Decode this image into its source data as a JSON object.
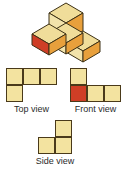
{
  "figure": {
    "colors": {
      "cube_top_face": "#f0dd9a",
      "cube_left_face": "#f2e3ab",
      "cube_right_face": "#e8a03c",
      "cube_red_face": "#cf3e26",
      "outline": "#3d3116",
      "square_fill": "#f3e3a0",
      "square_red_fill": "#cf3e26",
      "square_outline": "#4a3a1a",
      "label_text": "#2b2b2b",
      "background": "#ffffff"
    },
    "isometric": {
      "name": "cube-stack",
      "cube_count": 4,
      "description": "Four unit cubes: one back cube, one left cube with red front face, one center cube, one right cube",
      "cubes": [
        {
          "id": "back-cube",
          "grid": [
            1,
            1
          ],
          "front_face_color": "#f2e3ab",
          "right_face_color": "#e8a03c",
          "top_face_color": "#f0dd9a"
        },
        {
          "id": "left-cube",
          "grid": [
            0,
            0
          ],
          "front_face_color": "#cf3e26",
          "right_face_color": "#e8a03c",
          "top_face_color": "#f0dd9a"
        },
        {
          "id": "center-cube",
          "grid": [
            1,
            0
          ],
          "front_face_color": "#f2e3ab",
          "right_face_color": "#e8a03c",
          "top_face_color": "#f0dd9a"
        },
        {
          "id": "right-cube",
          "grid": [
            2,
            0
          ],
          "front_face_color": "#f2e3ab",
          "right_face_color": "#e8a03c",
          "top_face_color": "#f0dd9a"
        }
      ]
    },
    "views": [
      {
        "id": "top-view",
        "label": "Top view",
        "rows": 2,
        "cols": 3,
        "cells": [
          [
            "filled",
            "filled",
            "filled"
          ],
          [
            "filled",
            "empty",
            "empty"
          ]
        ]
      },
      {
        "id": "front-view",
        "label": "Front view",
        "rows": 2,
        "cols": 3,
        "cells": [
          [
            "filled",
            "empty",
            "empty"
          ],
          [
            "red",
            "filled",
            "filled"
          ]
        ]
      },
      {
        "id": "side-view",
        "label": "Side view",
        "rows": 2,
        "cols": 2,
        "cells": [
          [
            "empty",
            "filled"
          ],
          [
            "filled",
            "filled"
          ]
        ]
      }
    ]
  }
}
